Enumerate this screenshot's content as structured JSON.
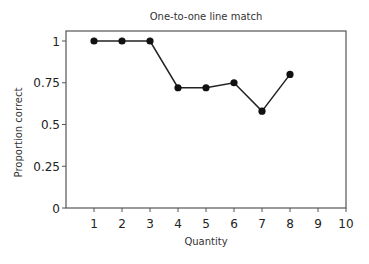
{
  "chart_data": {
    "type": "line",
    "title": "One-to-one line match",
    "xlabel": "Quantity",
    "ylabel": "Proportion correct",
    "x": [
      1,
      2,
      3,
      4,
      5,
      6,
      7,
      8
    ],
    "series": [
      {
        "name": "Proportion correct",
        "values": [
          1.0,
          1.0,
          1.0,
          0.72,
          0.72,
          0.75,
          0.58,
          0.8
        ]
      }
    ],
    "xticks": [
      1,
      2,
      3,
      4,
      5,
      6,
      7,
      8,
      9,
      10
    ],
    "yticks": [
      0,
      0.25,
      0.5,
      0.75,
      1
    ],
    "ytick_labels": [
      "0",
      "0.25",
      "0.5",
      "0.75",
      "1"
    ],
    "xlim": [
      0,
      10
    ],
    "ylim": [
      0,
      1.06
    ],
    "grid": false,
    "legend": null,
    "colors": {
      "line": "#222222",
      "marker": "#111111",
      "axis": "#555555"
    }
  }
}
